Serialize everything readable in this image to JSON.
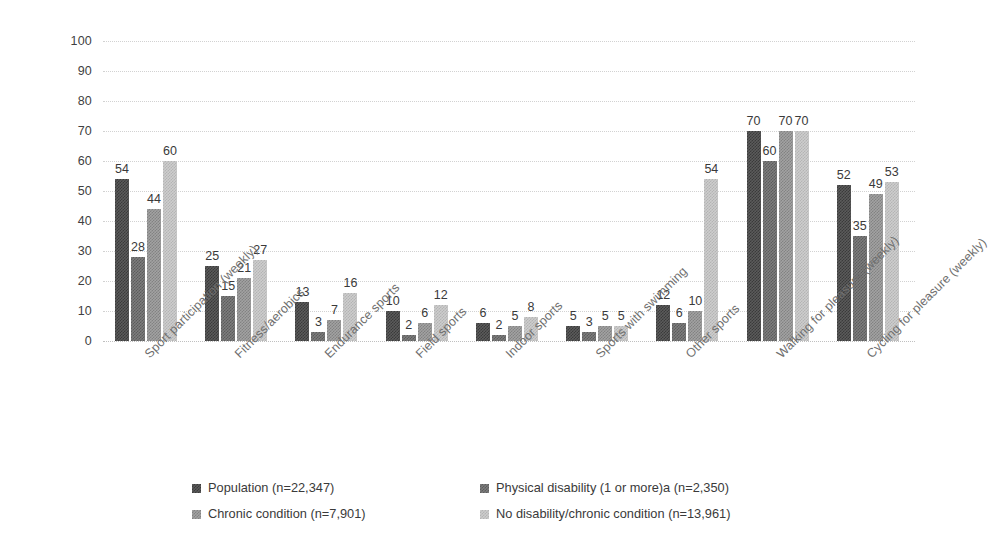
{
  "chart_data": {
    "type": "bar",
    "title": "",
    "subtitle": "",
    "xlabel": "",
    "ylabel": "",
    "ylim": [
      0,
      100
    ],
    "yticks": [
      0,
      10,
      20,
      30,
      40,
      50,
      60,
      70,
      80,
      90,
      100
    ],
    "grid": true,
    "legend_position": "bottom",
    "categories": [
      "Sport participation (weekly)",
      "Fitness/aerobics",
      "Endurance sports",
      "Field sports",
      "Indoor sports",
      "Sports with swimming",
      "Other sports",
      "Walking for pleasure (weekly)",
      "Cycling for pleasure (weekly)"
    ],
    "series": [
      {
        "name": "Population (n=22,347)",
        "color": "#3a3a3a",
        "tone": "tone0",
        "values": [
          54,
          25,
          13,
          10,
          6,
          5,
          12,
          70,
          52
        ]
      },
      {
        "name": "Physical disability (1 or more)a (n=2,350)",
        "color": "#5c5c5c",
        "tone": "tone1",
        "values": [
          28,
          15,
          3,
          2,
          2,
          3,
          6,
          60,
          35
        ]
      },
      {
        "name": "Chronic condition (n=7,901)",
        "color": "#828282",
        "tone": "tone2",
        "values": [
          44,
          21,
          7,
          6,
          5,
          5,
          10,
          70,
          49
        ]
      },
      {
        "name": "No disability/chronic condition  (n=13,961)",
        "color": "#b4b4b4",
        "tone": "tone3",
        "values": [
          60,
          27,
          16,
          12,
          8,
          5,
          54,
          70,
          53
        ]
      }
    ]
  },
  "legend": {
    "entries": [
      {
        "label": "Population (n=22,347)",
        "tone": "tone0"
      },
      {
        "label": "Physical disability (1 or more)a (n=2,350)",
        "tone": "tone1"
      },
      {
        "label": "Chronic condition (n=7,901)",
        "tone": "tone2"
      },
      {
        "label": "No disability/chronic condition  (n=13,961)",
        "tone": "tone3"
      }
    ]
  }
}
